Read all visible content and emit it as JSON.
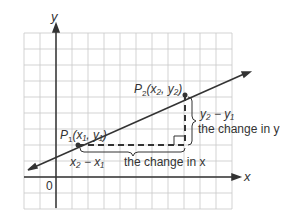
{
  "diagram": {
    "axes": {
      "x_label": "x",
      "y_label": "y",
      "origin_label": "0"
    },
    "points": {
      "p1": {
        "name": "P",
        "sub": "1",
        "coords": "(x₁, y₁)"
      },
      "p2": {
        "name": "P",
        "sub": "2",
        "coords": "(x₂, y₂)"
      }
    },
    "annotations": {
      "dy_expr": "y₂ − y₁",
      "dy_text": "the change in y",
      "dx_expr": "x₂ − x₁",
      "dx_text": "the change in x"
    },
    "colors": {
      "grid": "#c8c8c8",
      "line": "#333333",
      "bg": "#ffffff"
    }
  }
}
